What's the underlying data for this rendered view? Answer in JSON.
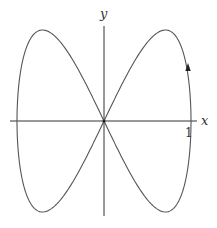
{
  "figure": {
    "x_axis_label": "x",
    "y_axis_label": "y",
    "x_tick_label": "1",
    "curve": "parametric figure-eight (Lissajous) curve",
    "direction_arrow": "up"
  },
  "chart_data": {
    "type": "line",
    "title": "",
    "xlabel": "x",
    "ylabel": "y",
    "parametric": {
      "x": "sin(t)",
      "y": "sin(2t)",
      "t_range": [
        0,
        6.2832
      ]
    },
    "xlim": [
      -1,
      1
    ],
    "ylim": [
      -1,
      1
    ],
    "x_ticks": [
      1
    ],
    "x_tick_labels": [
      "1"
    ],
    "grid": false,
    "annotations": [
      "arrow on right lobe near x=1 pointing upward",
      "dot at origin"
    ],
    "colors": {
      "curve": "#555555",
      "axes": "#333333",
      "background": "#ffffff"
    }
  }
}
